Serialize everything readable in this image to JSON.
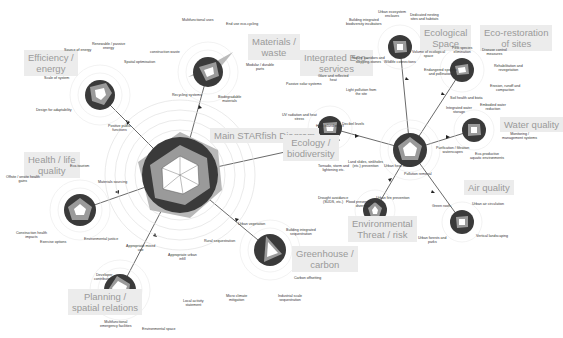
{
  "diagram": {
    "title": "Main STARfish Diagram",
    "colors": {
      "ring_dark": "#3a3a3a",
      "ring_mid": "#8a8a8a",
      "ring_light": "#c8c8c8",
      "fill_white": "#ffffff",
      "label_box": "#ececec",
      "label_text": "#9a9a9a",
      "connector": "#444444"
    },
    "categories": [
      {
        "id": "efficiency",
        "label": "Efficiency /\nenergy",
        "criteria": [
          "Source of energy",
          "Renewable / passive\nenergy",
          "Spatial optimisation",
          "Positive public\nfunctions",
          "Design for adaptability",
          "Scale of system"
        ]
      },
      {
        "id": "materials",
        "label": "Materials /\nwaste",
        "criteria": [
          "Multifunctional uses",
          "End use eco-cycling",
          "Modular / durable\nparts",
          "Biodegradable\nmaterials",
          "Recycling systems",
          "construction waste"
        ]
      },
      {
        "id": "integrated",
        "label": "Integrated Eco-\nservices",
        "criteria": [
          "Glare and reflected\nheat",
          "Light pollution from\nthe site",
          "Decibel levels",
          "Heat island effect",
          "UV radiation and heat\nstress",
          "Passive solar systems"
        ]
      },
      {
        "id": "ecological",
        "label": "Ecological\nSpace",
        "criteria": [
          "Urban ecosystem\nenclaves",
          "Dedicated nesting\nsites and habitats",
          "Volume of ecological\nspace",
          "Wildlife connections",
          "Nature corridors and\nstepping-stones",
          "Building integrated\nbiodiversity incubators"
        ]
      },
      {
        "id": "eco_restoration",
        "label": "Eco-restoration\nof sites",
        "criteria": [
          "Pest species\nelimination",
          "Disease control\nmeasures",
          "Rehabilitation and\nrevegetation",
          "Erosion, runoff and\ncompaction",
          "Soil health and biota",
          "Endangered species\nand pollination"
        ]
      },
      {
        "id": "water",
        "label": "Water quality",
        "criteria": [
          "Embodied water\nreduction",
          "Monitoring /\nmanagement systems",
          "Eco-productive\naquatic environments",
          "Purification / filtration\nwaterscapes",
          "Integrated water\nstorage"
        ]
      },
      {
        "id": "air",
        "label": "Air quality",
        "criteria": [
          "Green roofs",
          "Urban air circulation",
          "Vertical landscaping",
          "Urban forests and\nparks",
          "Pollution removal"
        ]
      },
      {
        "id": "threat",
        "label": "Environmental\nThreat / risk",
        "criteria": [
          "Land slides, sinkholes\n(etc.) prevention",
          "Urban heat island",
          "Urban fire prevention",
          "Flood prevention and\ndiversion",
          "Drought avoidance\n(SUDS, etc.)",
          "Tornado, storm and\nlightening etc."
        ]
      },
      {
        "id": "greenhouse",
        "label": "Greenhouse /\ncarbon",
        "criteria": [
          "Urban vegetation",
          "Building integrated\nsequestration",
          "Carbon offsetting",
          "Industrial scale\nsequestration",
          "Micro climate\nmitigation",
          "Rural sequestration"
        ]
      },
      {
        "id": "planning",
        "label": "Planning /\nspatial relations",
        "criteria": [
          "Appropriate mixed\nuse",
          "Appropriate urban\ninfill",
          "Local activity\nstatement",
          "Environmental space",
          "Multifunctional\nemergency facilities",
          "Developer\ncontributions"
        ]
      },
      {
        "id": "health",
        "label": "Health / life\nquality",
        "criteria": [
          "Eco-tourism",
          "Materials sourcing",
          "Environmental justice",
          "Exercise options",
          "Construction health\nimpacts",
          "Offsite / onsite health\ngains"
        ]
      }
    ],
    "main_hub_axes": [
      "Efficiency / energy",
      "Materials / waste",
      "Ecology / biodiversity",
      "Greenhouse / carbon",
      "Planning / spatial relations",
      "Health / life quality"
    ],
    "ecology_label": "Ecology /\nbiodiversity"
  }
}
